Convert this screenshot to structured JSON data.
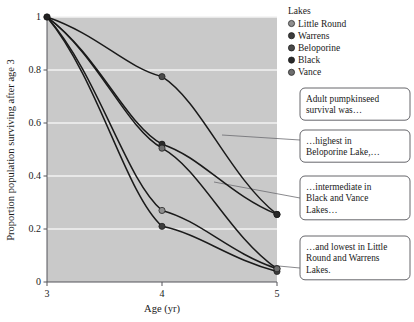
{
  "chart_data": {
    "type": "line",
    "title": "",
    "xlabel": "Age (yr)",
    "ylabel": "Proportion population surviving after age 3",
    "xlim": [
      3,
      5
    ],
    "ylim": [
      0,
      1
    ],
    "x": [
      3,
      4,
      5
    ],
    "xticks": [
      "3",
      "4",
      "5"
    ],
    "yticks": [
      "0",
      "0.2",
      "0.4",
      "0.6",
      "0.8",
      "1"
    ],
    "ytick_values": [
      0,
      0.2,
      0.4,
      0.6,
      0.8,
      1
    ],
    "grid": "horizontal-white",
    "plot_background": "#c9c9c9",
    "legend_position": "top-right",
    "legend_title": "Lakes",
    "series": [
      {
        "name": "Little Round",
        "values": [
          1.0,
          0.27,
          0.05
        ],
        "color": "#8f8f8f",
        "marker": "circle"
      },
      {
        "name": "Warrens",
        "values": [
          1.0,
          0.21,
          0.04
        ],
        "color": "#3d3d3d",
        "marker": "circle"
      },
      {
        "name": "Beloporine",
        "values": [
          1.0,
          0.775,
          0.255
        ],
        "color": "#4a4a4a",
        "marker": "circle"
      },
      {
        "name": "Black",
        "values": [
          1.0,
          0.52,
          0.255
        ],
        "color": "#2a2a2a",
        "marker": "circle"
      },
      {
        "name": "Vance",
        "values": [
          1.0,
          0.505,
          0.05
        ],
        "color": "#6e6e6e",
        "marker": "circle"
      }
    ]
  },
  "callouts": [
    {
      "id": "callout-1",
      "lines": [
        "Adult pumpkinseed",
        "survival was…"
      ],
      "has_leader": false
    },
    {
      "id": "callout-2",
      "lines": [
        "…highest in",
        "Beloporine Lake,…"
      ],
      "has_leader": true
    },
    {
      "id": "callout-3",
      "lines": [
        "…intermediate in",
        "Black and Vance",
        "Lakes…"
      ],
      "has_leader": true
    },
    {
      "id": "callout-4",
      "lines": [
        "…and lowest in Little",
        "Round and Warrens",
        "Lakes."
      ],
      "has_leader": true
    }
  ],
  "colors": {
    "plot_background": "#c9c9c9",
    "gridline": "#f2f2f2",
    "curve": "#1a1a1a",
    "axis": "#55555a",
    "callout_border": "#55555a",
    "leader_line": "#6b6b70",
    "page_background": "#ffffff"
  }
}
